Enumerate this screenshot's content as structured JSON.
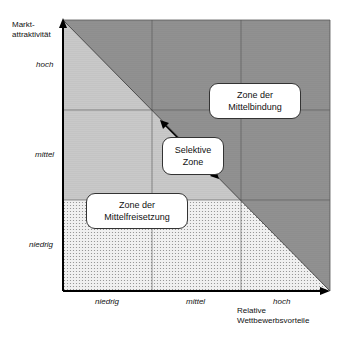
{
  "diagram": {
    "y_axis_title": "Markt-\nattraktivität",
    "x_axis_title": "Relative\nWettbewerbsvorteile",
    "y_ticks": [
      "hoch",
      "mittel",
      "niedrig"
    ],
    "x_ticks": [
      "niedrig",
      "mittel",
      "hoch"
    ],
    "zones": [
      {
        "name": "Zone der Mittelbindung",
        "line1": "Zone der",
        "line2": "Mittelbindung"
      },
      {
        "name": "Selektive Zone",
        "line1": "Selektive",
        "line2": "Zone"
      },
      {
        "name": "Zone der Mittelfreisetzung",
        "line1": "Zone der",
        "line2": "Mittelfreisetzung"
      }
    ],
    "colors": {
      "dark_zone": "#8c8c8c",
      "mid_zone": "#c4c4c4",
      "light_zone": "#e2e2e2",
      "grid": "#555555"
    }
  }
}
